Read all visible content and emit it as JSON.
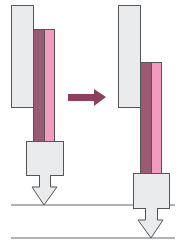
{
  "diagram": {
    "colors": {
      "plate_fill": "#e9ebec",
      "outline": "#555555",
      "dark_bar": "#9a5a74",
      "pink_bar": "#f29ac0",
      "arrow": "#8e3f5e",
      "line": "#666666"
    },
    "states": [
      {
        "name": "before",
        "plate": {
          "x": 11,
          "y": 5,
          "w": 22,
          "h": 102
        },
        "dark_bar": {
          "x": 33,
          "y": 29,
          "w": 11,
          "h": 112
        },
        "pink_bar": {
          "x": 44,
          "y": 29,
          "w": 10,
          "h": 112
        },
        "block": {
          "x": 26,
          "y": 141,
          "w": 37,
          "h": 34
        },
        "down_arrow": {
          "stem_x": 39,
          "stem_w": 11,
          "stem_top": 175,
          "head_top": 187,
          "head_left": 32,
          "head_right": 57,
          "tip_x": 44,
          "tip_y": 205
        }
      },
      {
        "name": "after",
        "plate": {
          "x": 118,
          "y": 5,
          "w": 22,
          "h": 102
        },
        "dark_bar": {
          "x": 140,
          "y": 62,
          "w": 11,
          "h": 111
        },
        "pink_bar": {
          "x": 151,
          "y": 62,
          "w": 10,
          "h": 111
        },
        "block": {
          "x": 133,
          "y": 173,
          "w": 36,
          "h": 35
        },
        "down_arrow": {
          "stem_x": 145,
          "stem_w": 12,
          "stem_top": 208,
          "head_top": 220,
          "head_left": 138,
          "head_right": 163,
          "tip_x": 151,
          "tip_y": 238
        }
      }
    ],
    "transition_arrow": {
      "shaft_x1": 68,
      "shaft_x2": 94,
      "shaft_y1": 94,
      "shaft_y2": 101,
      "head_top": 89,
      "head_bottom": 106,
      "tip_x": 106,
      "tip_y": 97
    },
    "reference_lines": [
      {
        "x1": 11,
        "x2": 175,
        "y": 205
      },
      {
        "x1": 11,
        "x2": 175,
        "y": 238
      }
    ]
  }
}
